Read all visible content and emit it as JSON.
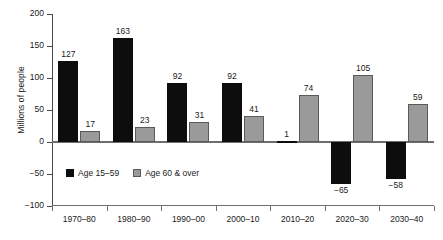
{
  "chart_data": {
    "type": "bar",
    "title": "",
    "subtitle": "",
    "xlabel": "",
    "ylabel": "Millions of people",
    "ylim": [
      -100,
      200
    ],
    "yticks": [
      200,
      150,
      100,
      50,
      0,
      -50,
      -100
    ],
    "ytick_labels": [
      "200",
      "150",
      "100",
      "50",
      "0",
      "−50",
      "−100"
    ],
    "grid": false,
    "legend_position": "inside-lower-left",
    "categories": [
      "1970–80",
      "1980–90",
      "1990–00",
      "2000–10",
      "2010–20",
      "2020–30",
      "2030–40"
    ],
    "series": [
      {
        "name": "Age 15–59",
        "color": "#0d0d0d",
        "values": [
          127,
          163,
          92,
          92,
          1,
          -65,
          -58
        ],
        "value_labels": [
          "127",
          "163",
          "92",
          "92",
          "1",
          "−65",
          "−58"
        ]
      },
      {
        "name": "Age 60 & over",
        "color": "#9a9a9a",
        "values": [
          17,
          23,
          31,
          41,
          74,
          105,
          59
        ],
        "value_labels": [
          "17",
          "23",
          "31",
          "41",
          "74",
          "105",
          "59"
        ]
      }
    ]
  }
}
